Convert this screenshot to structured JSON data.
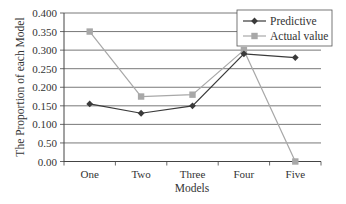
{
  "chart_data": {
    "type": "line",
    "title": "",
    "xlabel": "Models",
    "ylabel": "The Proportion of each Model",
    "categories": [
      "One",
      "Two",
      "Three",
      "Four",
      "Five"
    ],
    "yticks": [
      "0.00",
      "0.50",
      "0.100",
      "0.150",
      "0.200",
      "0.250",
      "0.300",
      "0.350",
      "0.400"
    ],
    "ylim": [
      0,
      0.4
    ],
    "grid": true,
    "legend_position": "top-right",
    "series": [
      {
        "name": "Predictive",
        "marker": "diamond",
        "color": "#3a3a3a",
        "values": [
          0.155,
          0.13,
          0.15,
          0.29,
          0.28
        ]
      },
      {
        "name": "Actual value",
        "marker": "square",
        "color": "#a8a8a8",
        "values": [
          0.35,
          0.175,
          0.18,
          0.3,
          0.0
        ]
      }
    ]
  }
}
